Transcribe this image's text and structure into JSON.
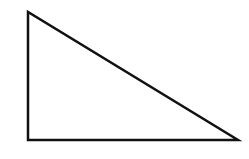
{
  "diagram": {
    "shape": "right-triangle",
    "vertices": [
      [
        28,
        12
      ],
      [
        28,
        140
      ],
      [
        238,
        140
      ]
    ],
    "stroke_color": "#111111",
    "fill_color": "#ffffff",
    "stroke_width": 2.5
  }
}
